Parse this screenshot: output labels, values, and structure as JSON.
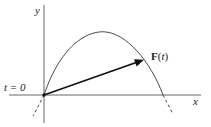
{
  "diagram": {
    "axes": {
      "x_label": "x",
      "y_label": "y"
    },
    "start_label": "t = 0",
    "vector_label": {
      "bold_part": "F",
      "paren_open": "(",
      "variable": "t",
      "paren_close": ")"
    },
    "colors": {
      "ink": "#222222",
      "background": "#ffffff"
    }
  }
}
